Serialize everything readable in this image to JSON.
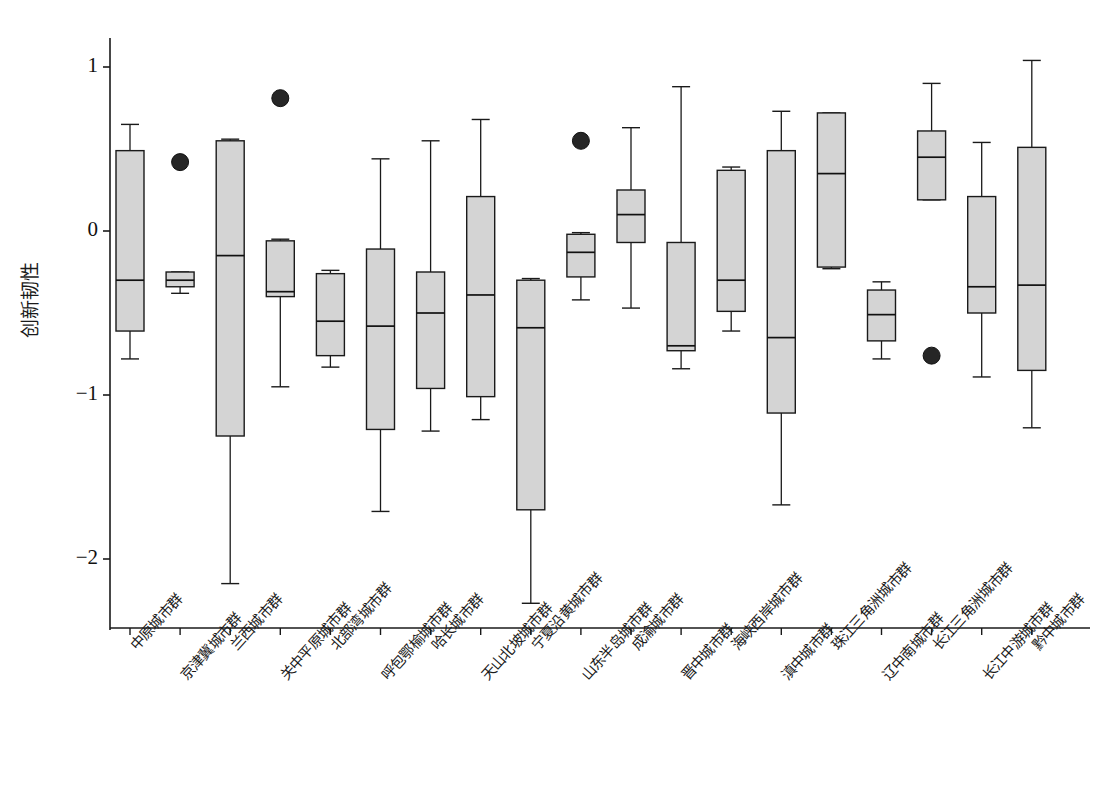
{
  "chart_data": {
    "type": "box",
    "title": "",
    "xlabel": "",
    "ylabel": "创新韧性",
    "ylim": [
      -2.45,
      1.25
    ],
    "yticks": [
      1,
      0,
      -1,
      -2
    ],
    "ytick_labels": [
      "1",
      "0",
      "−1",
      "−2"
    ],
    "grid": false,
    "legend": null,
    "box_fill_color": "#d4d4d4",
    "box_edge_color": "#1a1a1a",
    "outlier_color": "#262626",
    "categories": [
      "中原城市群",
      "京津冀城市群",
      "兰西城市群",
      "关中平原城市群",
      "北部湾城市群",
      "呼包鄂榆城市群",
      "哈长城市群",
      "天山北坡城市群",
      "宁夏沿黄城市群",
      "山东半岛城市群",
      "成渝城市群",
      "晋中城市群",
      "海峡西岸城市群",
      "滇中城市群",
      "珠江三角洲城市群",
      "辽中南城市群",
      "长江三角洲城市群",
      "长江中游城市群",
      "黔中城市群"
    ],
    "boxes": [
      {
        "label": "中原城市群",
        "whisker_low": -0.78,
        "q1": -0.61,
        "median": -0.3,
        "q3": 0.49,
        "whisker_high": 0.65,
        "outliers": []
      },
      {
        "label": "京津冀城市群",
        "whisker_low": -0.38,
        "q1": -0.34,
        "median": -0.3,
        "q3": -0.25,
        "whisker_high": -0.25,
        "outliers": [
          0.42
        ]
      },
      {
        "label": "兰西城市群",
        "whisker_low": -2.15,
        "q1": -1.25,
        "median": -0.15,
        "q3": 0.55,
        "whisker_high": 0.56,
        "outliers": []
      },
      {
        "label": "关中平原城市群",
        "whisker_low": -0.95,
        "q1": -0.4,
        "median": -0.37,
        "q3": -0.06,
        "whisker_high": -0.05,
        "outliers": [
          0.81
        ]
      },
      {
        "label": "北部湾城市群",
        "whisker_low": -0.83,
        "q1": -0.76,
        "median": -0.55,
        "q3": -0.26,
        "whisker_high": -0.24,
        "outliers": []
      },
      {
        "label": "呼包鄂榆城市群",
        "whisker_low": -1.71,
        "q1": -1.21,
        "median": -0.58,
        "q3": -0.11,
        "whisker_high": 0.44,
        "outliers": []
      },
      {
        "label": "哈长城市群",
        "whisker_low": -1.22,
        "q1": -0.96,
        "median": -0.5,
        "q3": -0.25,
        "whisker_high": 0.55,
        "outliers": []
      },
      {
        "label": "天山北坡城市群",
        "whisker_low": -1.15,
        "q1": -1.01,
        "median": -0.39,
        "q3": 0.21,
        "whisker_high": 0.68,
        "outliers": []
      },
      {
        "label": "宁夏沿黄城市群",
        "whisker_low": -2.27,
        "q1": -1.7,
        "median": -0.59,
        "q3": -0.3,
        "whisker_high": -0.29,
        "outliers": []
      },
      {
        "label": "山东半岛城市群",
        "whisker_low": -0.42,
        "q1": -0.28,
        "median": -0.13,
        "q3": -0.02,
        "whisker_high": -0.01,
        "outliers": [
          0.55
        ]
      },
      {
        "label": "成渝城市群",
        "whisker_low": -0.47,
        "q1": -0.07,
        "median": 0.1,
        "q3": 0.25,
        "whisker_high": 0.63,
        "outliers": []
      },
      {
        "label": "晋中城市群",
        "whisker_low": -0.84,
        "q1": -0.73,
        "median": -0.7,
        "q3": -0.07,
        "whisker_high": 0.88,
        "outliers": []
      },
      {
        "label": "海峡西岸城市群",
        "whisker_low": -0.61,
        "q1": -0.49,
        "median": -0.3,
        "q3": 0.37,
        "whisker_high": 0.39,
        "outliers": []
      },
      {
        "label": "滇中城市群",
        "whisker_low": -1.67,
        "q1": -1.11,
        "median": -0.65,
        "q3": 0.49,
        "whisker_high": 0.73,
        "outliers": []
      },
      {
        "label": "珠江三角洲城市群",
        "whisker_low": -0.23,
        "q1": -0.22,
        "median": 0.35,
        "q3": 0.72,
        "whisker_high": 0.72,
        "outliers": []
      },
      {
        "label": "辽中南城市群",
        "whisker_low": -0.78,
        "q1": -0.67,
        "median": -0.51,
        "q3": -0.36,
        "whisker_high": -0.31,
        "outliers": []
      },
      {
        "label": "长江三角洲城市群",
        "whisker_low": 0.19,
        "q1": 0.19,
        "median": 0.45,
        "q3": 0.61,
        "whisker_high": 0.9,
        "outliers": [
          -0.76
        ]
      },
      {
        "label": "长江中游城市群",
        "whisker_low": -0.89,
        "q1": -0.5,
        "median": -0.34,
        "q3": 0.21,
        "whisker_high": 0.54,
        "outliers": []
      },
      {
        "label": "黔中城市群",
        "whisker_low": -1.2,
        "q1": -0.85,
        "median": -0.33,
        "q3": 0.51,
        "whisker_high": 1.04,
        "outliers": []
      }
    ]
  },
  "axes": {
    "y_axis_title": "创新韧性",
    "y_tick_labels": [
      "1",
      "0",
      "−1",
      "−2"
    ]
  }
}
